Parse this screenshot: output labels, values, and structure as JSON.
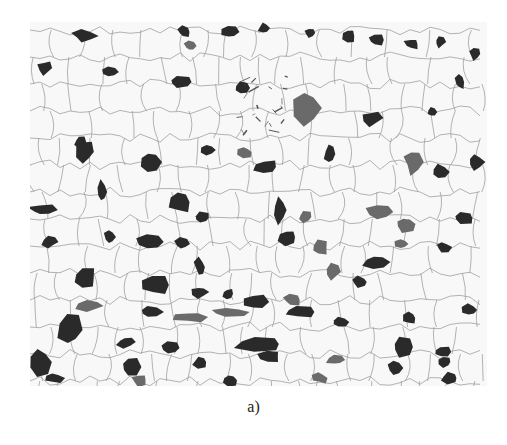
{
  "figure": {
    "caption": "a)",
    "image_description": "Optical micrograph of ferrite-pearlite microstructure: light ferrite grains with thin grain boundaries and dark pearlite islands, banded horizontally",
    "colors": {
      "background": "#ffffff",
      "ferrite": "#f7f7f7",
      "boundary": "#9a9a9a",
      "pearlite": "#2a2a2a",
      "pearlite_light": "#6a6a6a"
    },
    "pearlite_blobs": [
      [
        55,
        14,
        14,
        6
      ],
      [
        154,
        10,
        7,
        6
      ],
      [
        160,
        24,
        6,
        5
      ],
      [
        200,
        10,
        8,
        6
      ],
      [
        234,
        6,
        6,
        6
      ],
      [
        280,
        11,
        6,
        5
      ],
      [
        319,
        14,
        8,
        8
      ],
      [
        346,
        18,
        8,
        6
      ],
      [
        382,
        22,
        8,
        6
      ],
      [
        410,
        20,
        6,
        6
      ],
      [
        445,
        32,
        6,
        6
      ],
      [
        15,
        46,
        8,
        8
      ],
      [
        80,
        50,
        8,
        5
      ],
      [
        150,
        60,
        14,
        6
      ],
      [
        212,
        66,
        8,
        6
      ],
      [
        277,
        86,
        14,
        18
      ],
      [
        342,
        96,
        10,
        8
      ],
      [
        430,
        60,
        5,
        8
      ],
      [
        402,
        90,
        6,
        6
      ],
      [
        50,
        120,
        6,
        6
      ],
      [
        55,
        130,
        10,
        12
      ],
      [
        120,
        140,
        10,
        10
      ],
      [
        178,
        128,
        8,
        6
      ],
      [
        215,
        130,
        8,
        6
      ],
      [
        236,
        145,
        14,
        8
      ],
      [
        300,
        132,
        6,
        10
      ],
      [
        383,
        140,
        10,
        12
      ],
      [
        410,
        150,
        10,
        8
      ],
      [
        446,
        140,
        8,
        8
      ],
      [
        72,
        170,
        6,
        12
      ],
      [
        12,
        188,
        14,
        6
      ],
      [
        150,
        180,
        12,
        12
      ],
      [
        172,
        196,
        10,
        6
      ],
      [
        250,
        188,
        8,
        14
      ],
      [
        275,
        195,
        8,
        6
      ],
      [
        350,
        190,
        14,
        8
      ],
      [
        375,
        202,
        12,
        8
      ],
      [
        433,
        196,
        12,
        6
      ],
      [
        20,
        220,
        8,
        6
      ],
      [
        80,
        215,
        6,
        8
      ],
      [
        120,
        220,
        14,
        8
      ],
      [
        152,
        222,
        8,
        6
      ],
      [
        170,
        245,
        6,
        10
      ],
      [
        258,
        215,
        10,
        8
      ],
      [
        290,
        226,
        10,
        8
      ],
      [
        303,
        250,
        8,
        8
      ],
      [
        346,
        240,
        14,
        8
      ],
      [
        372,
        222,
        8,
        6
      ],
      [
        413,
        225,
        8,
        6
      ],
      [
        55,
        256,
        14,
        12
      ],
      [
        125,
        263,
        14,
        10
      ],
      [
        170,
        270,
        8,
        6
      ],
      [
        198,
        272,
        6,
        6
      ],
      [
        225,
        280,
        12,
        8
      ],
      [
        262,
        278,
        10,
        6
      ],
      [
        330,
        260,
        10,
        6
      ],
      [
        60,
        284,
        14,
        6
      ],
      [
        120,
        290,
        12,
        6
      ],
      [
        160,
        295,
        16,
        6
      ],
      [
        200,
        290,
        22,
        5
      ],
      [
        270,
        290,
        16,
        6
      ],
      [
        310,
        300,
        10,
        6
      ],
      [
        380,
        296,
        8,
        8
      ],
      [
        440,
        288,
        8,
        6
      ],
      [
        40,
        308,
        12,
        16
      ],
      [
        96,
        320,
        10,
        6
      ],
      [
        140,
        326,
        10,
        6
      ],
      [
        230,
        322,
        26,
        8
      ],
      [
        372,
        325,
        12,
        10
      ],
      [
        412,
        330,
        10,
        6
      ],
      [
        10,
        340,
        12,
        14
      ],
      [
        100,
        345,
        10,
        10
      ],
      [
        170,
        340,
        8,
        6
      ],
      [
        240,
        335,
        12,
        6
      ],
      [
        306,
        338,
        10,
        6
      ],
      [
        365,
        346,
        8,
        8
      ],
      [
        415,
        340,
        8,
        6
      ],
      [
        24,
        356,
        10,
        6
      ],
      [
        110,
        358,
        8,
        6
      ],
      [
        200,
        358,
        8,
        6
      ],
      [
        290,
        356,
        8,
        6
      ],
      [
        420,
        356,
        10,
        6
      ]
    ],
    "inclusion": {
      "x": 205,
      "y": 55,
      "w": 55,
      "h": 60
    }
  }
}
